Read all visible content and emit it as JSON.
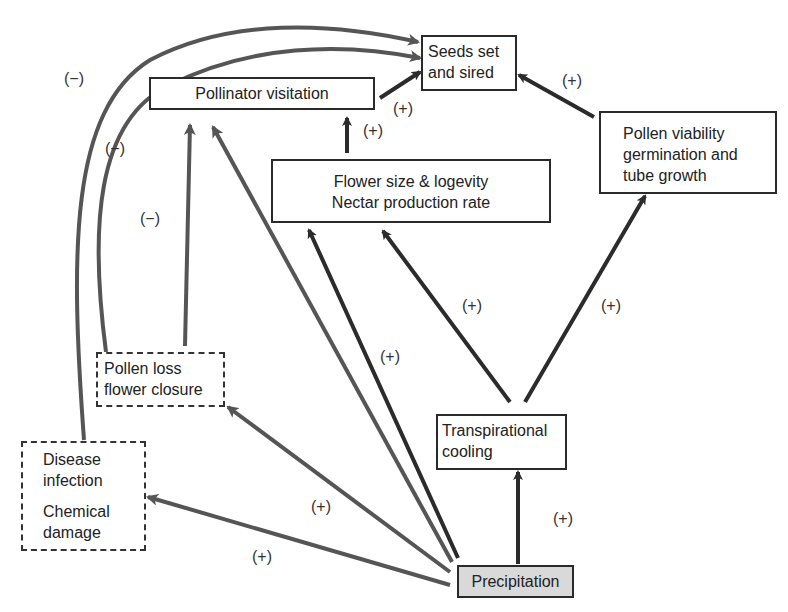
{
  "nodes": {
    "seeds": {
      "line1": "Seeds set",
      "line2": "and sired"
    },
    "pollinator": {
      "text": "Pollinator visitation"
    },
    "flower": {
      "line1": "Flower size & logevity",
      "line2": "Nectar production rate"
    },
    "pollen_viability": {
      "line1": "Pollen viability",
      "line2": "germination and",
      "line3": "tube growth"
    },
    "pollen_loss": {
      "line1": "Pollen loss",
      "line2": "flower closure"
    },
    "disease": {
      "line1": "Disease",
      "line2": "infection",
      "line3": "Chemical",
      "line4": "damage"
    },
    "transpirational": {
      "line1": "Transpirational",
      "line2": "cooling"
    },
    "precipitation": {
      "text": "Precipitation"
    }
  },
  "edge_labels": {
    "disease_to_seeds": "(−)",
    "pollen_loss_to_seeds": "(−)",
    "pollen_loss_to_pollinator": "(−)",
    "pollinator_to_seeds": "(+)",
    "flower_to_pollinator": "(+)",
    "viability_to_seeds": "(+)",
    "transp_to_flower": "(+)",
    "transp_to_viability": "(+)",
    "precip_to_flower": "(+)",
    "precip_to_pollen_loss": "(+)",
    "precip_to_disease": "(+)",
    "precip_to_transp": "(+)"
  },
  "colors": {
    "arrow_dark": "#2b2b2b",
    "arrow_gray": "#555555",
    "precipitation_fill": "#d9d9d9"
  }
}
